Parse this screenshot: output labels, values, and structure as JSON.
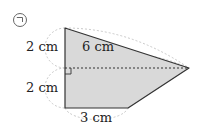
{
  "diagram": {
    "marker": "㉠",
    "labels": {
      "left_top": "2 cm",
      "left_bottom": "2 cm",
      "diagonal": "6 cm",
      "bottom": "3 cm"
    },
    "colors": {
      "fill": "#d9d9d9",
      "stroke": "#333333",
      "dashed": "#333333",
      "guide_arc": "#bbbbbb"
    },
    "shape": "quadrilateral with right angle at dashed diagonal"
  }
}
